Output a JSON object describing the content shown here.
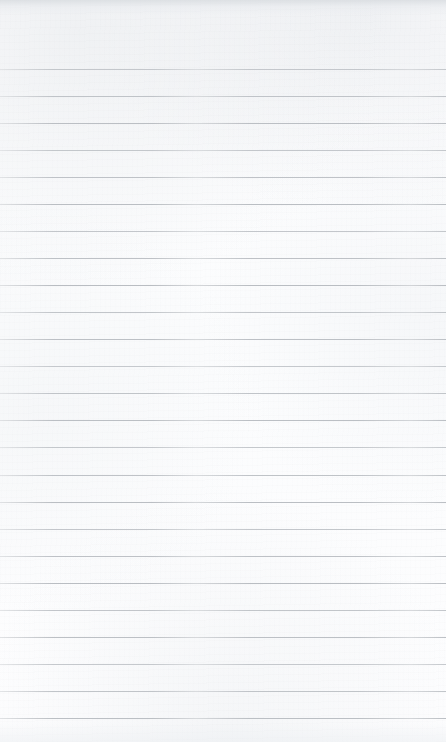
{
  "document": {
    "kind": "scanned-blank-lined-page",
    "title": "Blank lined notebook page",
    "page_width": 446,
    "page_height": 742,
    "orientation": "portrait",
    "has_text_content": false,
    "visible_text": ""
  },
  "paper": {
    "background_color": "#fdfdfd",
    "tint_color": "#f6f8f9",
    "grain_color": "#969ba2",
    "scan_edge_top_color": "#d6dade",
    "scan_edge_bottom_color": "#eceff2"
  },
  "ruling": {
    "style": "horizontal-ruled",
    "line_color": "#b9bdc2",
    "line_thickness_px": 1,
    "line_spacing_px": 27,
    "first_line_y": 69,
    "last_line_y": 718,
    "line_count": 25,
    "left_inset_px": 0,
    "right_inset_px": 0,
    "top_margin_px": 69,
    "bottom_margin_px": 24,
    "has_vertical_margin_rule": false,
    "has_header_rule": false,
    "line_y_positions": [
      69,
      96,
      123,
      150,
      177,
      204,
      231,
      258,
      285,
      312,
      339,
      366,
      393,
      420,
      447,
      475,
      502,
      529,
      556,
      583,
      610,
      637,
      664,
      691,
      718
    ],
    "line_labels": [
      "line-1",
      "line-2",
      "line-3",
      "line-4",
      "line-5",
      "line-6",
      "line-7",
      "line-8",
      "line-9",
      "line-10",
      "line-11",
      "line-12",
      "line-13",
      "line-14",
      "line-15",
      "line-16",
      "line-17",
      "line-18",
      "line-19",
      "line-20",
      "line-21",
      "line-22",
      "line-23",
      "line-24",
      "line-25"
    ]
  },
  "zones": {
    "top_margin_label": "top-margin",
    "bottom_margin_label": "bottom-margin",
    "write_zone_label": "writing-line"
  }
}
